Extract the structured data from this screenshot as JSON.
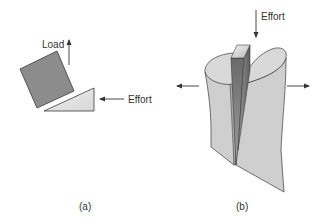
{
  "figure": {
    "panel_a": {
      "caption": "(a)",
      "load_label": "Load",
      "effort_label": "Effort",
      "block_color": "#8c8c8c",
      "wedge_color": "#e4e4e4"
    },
    "panel_b": {
      "caption": "(b)",
      "effort_label": "Effort",
      "wood_color": "#cfcfcf",
      "wedge_top_color": "#dcdcdc",
      "wedge_side_color": "#7a7a7a"
    },
    "colors": {
      "outline": "#3a3a3a",
      "arrow": "#333333",
      "background": "#ffffff"
    }
  }
}
